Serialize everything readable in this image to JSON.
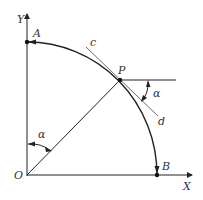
{
  "diagram": {
    "labels": {
      "y_axis": "Y",
      "x_axis": "X",
      "origin": "O",
      "point_a": "A",
      "point_b": "B",
      "point_p": "P",
      "tangent_start": "c",
      "tangent_end": "d",
      "angle_origin": "α",
      "angle_p": "α"
    },
    "colors": {
      "stroke": "#222222",
      "text": "#333333"
    }
  }
}
